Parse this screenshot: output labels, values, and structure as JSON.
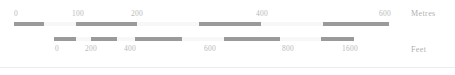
{
  "widget": {
    "name": "map-scale-bar",
    "background": "#ffffff",
    "segment_dark_color": "#9a9a9a",
    "segment_light_color": "#f7f7f7",
    "label_color": "#b9b9b9"
  },
  "scales": [
    {
      "id": "metres",
      "unit_label": "Metres",
      "tick_labels": [
        "0",
        "100",
        "200",
        "400",
        "600"
      ],
      "tick_positions_px": [
        16,
        78,
        137,
        262,
        385
      ],
      "bar": {
        "left_px": 14,
        "width_px": 375,
        "segments": [
          {
            "start_px": 0,
            "width_px": 30,
            "shade": "dark"
          },
          {
            "start_px": 30,
            "width_px": 32,
            "shade": "light"
          },
          {
            "start_px": 62,
            "width_px": 61,
            "shade": "dark"
          },
          {
            "start_px": 123,
            "width_px": 62,
            "shade": "light"
          },
          {
            "start_px": 185,
            "width_px": 62,
            "shade": "dark"
          },
          {
            "start_px": 247,
            "width_px": 62,
            "shade": "light"
          },
          {
            "start_px": 309,
            "width_px": 66,
            "shade": "dark"
          }
        ]
      }
    },
    {
      "id": "feet",
      "unit_label": "Feet",
      "tick_labels": [
        "0",
        "200",
        "400",
        "600",
        "800",
        "1600"
      ],
      "tick_positions_px": [
        57,
        91,
        130,
        210,
        288,
        350
      ],
      "bar": {
        "left_px": 54,
        "width_px": 300,
        "segments": [
          {
            "start_px": 0,
            "width_px": 22,
            "shade": "dark"
          },
          {
            "start_px": 22,
            "width_px": 15,
            "shade": "light"
          },
          {
            "start_px": 37,
            "width_px": 26,
            "shade": "dark"
          },
          {
            "start_px": 63,
            "width_px": 18,
            "shade": "light"
          },
          {
            "start_px": 81,
            "width_px": 47,
            "shade": "dark"
          },
          {
            "start_px": 128,
            "width_px": 42,
            "shade": "light"
          },
          {
            "start_px": 170,
            "width_px": 56,
            "shade": "dark"
          },
          {
            "start_px": 226,
            "width_px": 41,
            "shade": "light"
          },
          {
            "start_px": 267,
            "width_px": 33,
            "shade": "dark"
          }
        ]
      }
    }
  ]
}
